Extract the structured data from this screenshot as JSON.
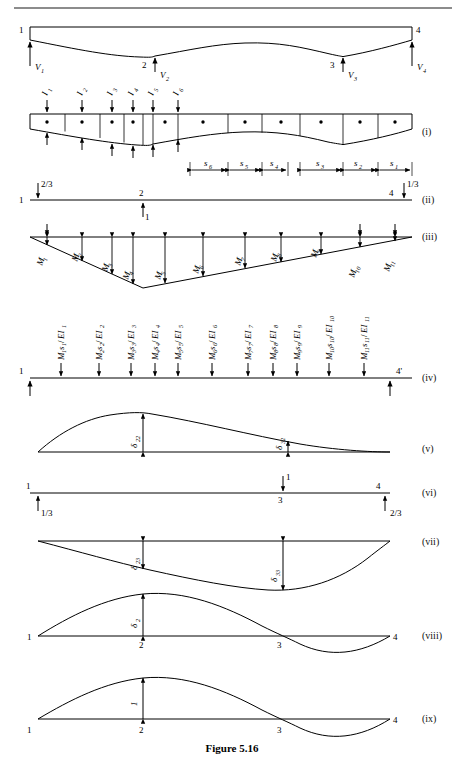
{
  "figure": {
    "caption": "Figure 5.16",
    "top_rule": true
  },
  "panels": [
    {
      "id": "panel-beam",
      "roman": "",
      "nodes": [
        "1",
        "2",
        "3",
        "4"
      ],
      "reactions": [
        "V1",
        "V2",
        "V3",
        "V4"
      ],
      "reaction_labels": [
        {
          "base": "V",
          "sub": "1"
        },
        {
          "base": "V",
          "sub": "2"
        },
        {
          "base": "V",
          "sub": "3"
        },
        {
          "base": "V",
          "sub": "4"
        }
      ]
    },
    {
      "id": "panel-i",
      "roman": "(i)",
      "inertia_labels": [
        {
          "base": "I",
          "sub": "1"
        },
        {
          "base": "I",
          "sub": "2"
        },
        {
          "base": "I",
          "sub": "3"
        },
        {
          "base": "I",
          "sub": "4"
        },
        {
          "base": "I",
          "sub": "5"
        },
        {
          "base": "I",
          "sub": "6"
        }
      ],
      "segment_labels": [
        {
          "base": "s",
          "sub": "6"
        },
        {
          "base": "s",
          "sub": "5"
        },
        {
          "base": "s",
          "sub": "4"
        },
        {
          "base": "s",
          "sub": "3"
        },
        {
          "base": "s",
          "sub": "2"
        },
        {
          "base": "s",
          "sub": "1"
        }
      ],
      "segment_count": 11
    },
    {
      "id": "panel-ii",
      "roman": "(ii)",
      "nodes": [
        "1",
        "2",
        "4"
      ],
      "reaction_left": "2/3",
      "reaction_right": "1/3",
      "unit_load": "1"
    },
    {
      "id": "panel-iii",
      "roman": "(iii)",
      "moment_labels": [
        {
          "base": "M",
          "sub": "1"
        },
        {
          "base": "M",
          "sub": "2"
        },
        {
          "base": "M",
          "sub": "3"
        },
        {
          "base": "M",
          "sub": "4"
        },
        {
          "base": "M",
          "sub": "5"
        },
        {
          "base": "M",
          "sub": "6"
        },
        {
          "base": "M",
          "sub": "7"
        },
        {
          "base": "M",
          "sub": "8"
        },
        {
          "base": "M",
          "sub": "9"
        },
        {
          "base": "M",
          "sub": "10"
        },
        {
          "base": "M",
          "sub": "11"
        }
      ]
    },
    {
      "id": "panel-iv",
      "roman": "(iv)",
      "nodes": [
        "1",
        "4'"
      ],
      "elastic_weights": [
        {
          "m": "M",
          "ms": "1",
          "s": "s",
          "ss": "1",
          "ei": "EI",
          "eis": "1"
        },
        {
          "m": "M",
          "ms": "2",
          "s": "s",
          "ss": "2",
          "ei": "EI",
          "eis": "2"
        },
        {
          "m": "M",
          "ms": "3",
          "s": "s",
          "ss": "3",
          "ei": "EI",
          "eis": "3"
        },
        {
          "m": "M",
          "ms": "4",
          "s": "s",
          "ss": "4",
          "ei": "EI",
          "eis": "4"
        },
        {
          "m": "M",
          "ms": "5",
          "s": "s",
          "ss": "5",
          "ei": "EI",
          "eis": "5"
        },
        {
          "m": "M",
          "ms": "6",
          "s": "s",
          "ss": "6",
          "ei": "EI",
          "eis": "6"
        },
        {
          "m": "M",
          "ms": "7",
          "s": "s",
          "ss": "7",
          "ei": "EI",
          "eis": "7"
        },
        {
          "m": "M",
          "ms": "8",
          "s": "s",
          "ss": "8",
          "ei": "EI",
          "eis": "8"
        },
        {
          "m": "M",
          "ms": "9",
          "s": "s",
          "ss": "9",
          "ei": "EI",
          "eis": "9"
        },
        {
          "m": "M",
          "ms": "10",
          "s": "s",
          "ss": "10",
          "ei": "EI",
          "eis": "10"
        },
        {
          "m": "M",
          "ms": "11",
          "s": "s",
          "ss": "11",
          "ei": "EI",
          "eis": "11"
        }
      ]
    },
    {
      "id": "panel-v",
      "roman": "(v)",
      "deflections": [
        {
          "base": "δ",
          "sub": "22"
        },
        {
          "base": "δ",
          "sub": "32"
        }
      ]
    },
    {
      "id": "panel-vi",
      "roman": "(vi)",
      "nodes": [
        "1",
        "3",
        "4"
      ],
      "reaction_left": "1/3",
      "reaction_right": "2/3",
      "unit_load": "1"
    },
    {
      "id": "panel-vii",
      "roman": "(vii)",
      "deflections": [
        {
          "base": "δ",
          "sub": "23"
        },
        {
          "base": "δ",
          "sub": "33"
        }
      ]
    },
    {
      "id": "panel-viii",
      "roman": "(viii)",
      "nodes": [
        "1",
        "2",
        "3",
        "4"
      ],
      "deflections": [
        {
          "base": "δ",
          "sub": "2"
        }
      ]
    },
    {
      "id": "panel-ix",
      "roman": "(ix)",
      "nodes": [
        "1",
        "2",
        "3",
        "4"
      ],
      "deflections": [
        {
          "base": "1",
          "sub": ""
        }
      ]
    }
  ],
  "colors": {
    "ink": "#000000",
    "rule": "#555555",
    "paper": "#ffffff"
  }
}
